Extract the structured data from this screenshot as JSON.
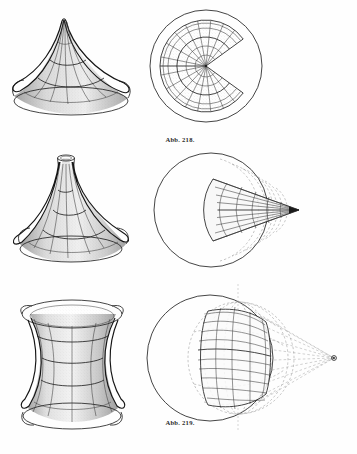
{
  "page": {
    "corner_mark": "",
    "background_color": "#fefefe",
    "ink_color": "#2a2a2a",
    "dash_color": "#8d8d8d"
  },
  "figures": [
    {
      "id": "fig-218",
      "caption": "Abb. 218.",
      "left": {
        "name": "cone-like-surface-of-revolution",
        "description": "Surface of revolution of constant negative curvature, conical type with cusp at top and flared rim",
        "icon": "cone-surface-icon"
      },
      "right": {
        "name": "plane-development-circular-sector",
        "description": "Development in the plane: circular sector with missing wedge, polar grid of radii and concentric arcs inside a larger full circle",
        "icon": "polar-sector-icon",
        "outer_circle_radius": 58,
        "sector_radius": 46,
        "sector_gap_degrees": 72,
        "radial_lines": 9,
        "arc_count": 5
      }
    },
    {
      "id": "fig-219",
      "caption": "Abb. 219.",
      "left": {
        "name": "trumpet-surface-of-revolution",
        "description": "Surface of revolution of constant negative curvature, trumpet / pseudosphere type with narrow open tube at top and wide flared base",
        "icon": "trumpet-surface-icon"
      },
      "right": {
        "name": "plane-development-narrow-wedge",
        "description": "Development in the plane: narrow wedge with vertex at the right inside a circle, grid of rays and arcs, dashed continuation arcs",
        "icon": "wedge-grid-icon",
        "circle_radius": 58,
        "wedge_half_angle_degrees": 20,
        "grid_rays": 9,
        "grid_arcs": 6
      }
    },
    {
      "id": "fig-220",
      "caption": "Abb. 220.",
      "left": {
        "name": "hyperboloid-surface-of-revolution",
        "description": "Surface of revolution of constant negative curvature, hyperboloid / catenoid type with waist in the middle and flared top and bottom rims",
        "icon": "hyperboloid-surface-icon"
      },
      "right": {
        "name": "sphere-development-lune-with-pole",
        "description": "Development on the sphere: grid lune on a great circle, dashed meridians and parallels, dashed rays converging to an external pole point at the right",
        "icon": "sphere-lune-icon",
        "circle_radius": 64,
        "lune_grid_columns": 5,
        "lune_grid_rows": 9,
        "pole_point_label": ""
      }
    }
  ]
}
